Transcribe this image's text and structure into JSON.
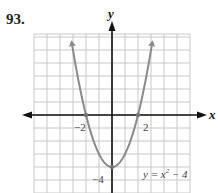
{
  "problem": {
    "number": "93."
  },
  "chart_data": {
    "type": "line",
    "title": "",
    "function_label": "y = x² − 4",
    "function_label_parts": {
      "lhs": "y = x",
      "exp": "2",
      "rhs": " − 4"
    },
    "xlabel": "x",
    "ylabel": "y",
    "xlim": [
      -6,
      6
    ],
    "ylim": [
      -6,
      6
    ],
    "grid": true,
    "tick_labels": {
      "x": [
        "−2",
        "2"
      ],
      "y": [
        "−4"
      ]
    },
    "tick_values": {
      "x": [
        -2,
        2
      ],
      "y": [
        -4
      ]
    },
    "series": [
      {
        "name": "y = x^2 - 4",
        "x": [
          -3.2,
          -3,
          -2.5,
          -2,
          -1.5,
          -1,
          -0.5,
          0,
          0.5,
          1,
          1.5,
          2,
          2.5,
          3,
          3.2
        ],
        "y": [
          6.24,
          5,
          2.25,
          0,
          -1.75,
          -3,
          -3.75,
          -4,
          -3.75,
          -3,
          -1.75,
          0,
          2.25,
          5,
          6.24
        ]
      }
    ],
    "marked_points": [
      {
        "x": -2,
        "y": 0
      },
      {
        "x": 2,
        "y": 0
      },
      {
        "x": 0,
        "y": -4
      }
    ],
    "colors": {
      "curve": "#8a8a8a",
      "grid": "#c8c8c8",
      "axes": "#111111"
    }
  }
}
